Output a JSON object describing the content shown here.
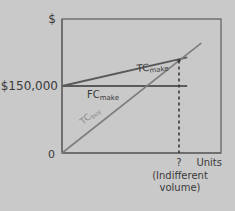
{
  "chart_data": {
    "type": "line",
    "title": "",
    "xlabel": "Units",
    "ylabel": "$",
    "grid": false,
    "legend": "none",
    "x_ticks": [
      {
        "value": 0,
        "label": "0"
      },
      {
        "value": 1,
        "label": "?"
      }
    ],
    "y_ticks": [
      {
        "value": 150000,
        "label": "$150,000"
      }
    ],
    "origin_label": "0",
    "xlim": [
      0,
      1.33
    ],
    "ylim": [
      0,
      350000
    ],
    "series": [
      {
        "name": "TC_make",
        "label_main": "TC",
        "label_sub": "make",
        "points": [
          [
            0,
            150000
          ],
          [
            1.07,
            214000
          ]
        ]
      },
      {
        "name": "FC_make",
        "label_main": "FC",
        "label_sub": "make",
        "points": [
          [
            0,
            150000
          ],
          [
            1.07,
            150000
          ]
        ]
      },
      {
        "name": "TC_buy",
        "label_main": "TC",
        "label_sub": "buy",
        "points": [
          [
            0,
            0
          ],
          [
            1.19,
            246000
          ]
        ]
      }
    ],
    "annotations": [
      {
        "type": "vertical-dashed",
        "x": 1,
        "from_y": 0,
        "to_y": 207000,
        "label": "?",
        "caption_lines": [
          "(Indifferent",
          "volume)"
        ]
      }
    ]
  },
  "colors": {
    "background": "#c9c9c9",
    "axis": "#666666",
    "tc_make": "#5a5a5a",
    "fc_make": "#5a5a5a",
    "tc_buy": "#7d7d7d",
    "dashed": "#3a3a3a",
    "text": "#3a3a3a"
  }
}
